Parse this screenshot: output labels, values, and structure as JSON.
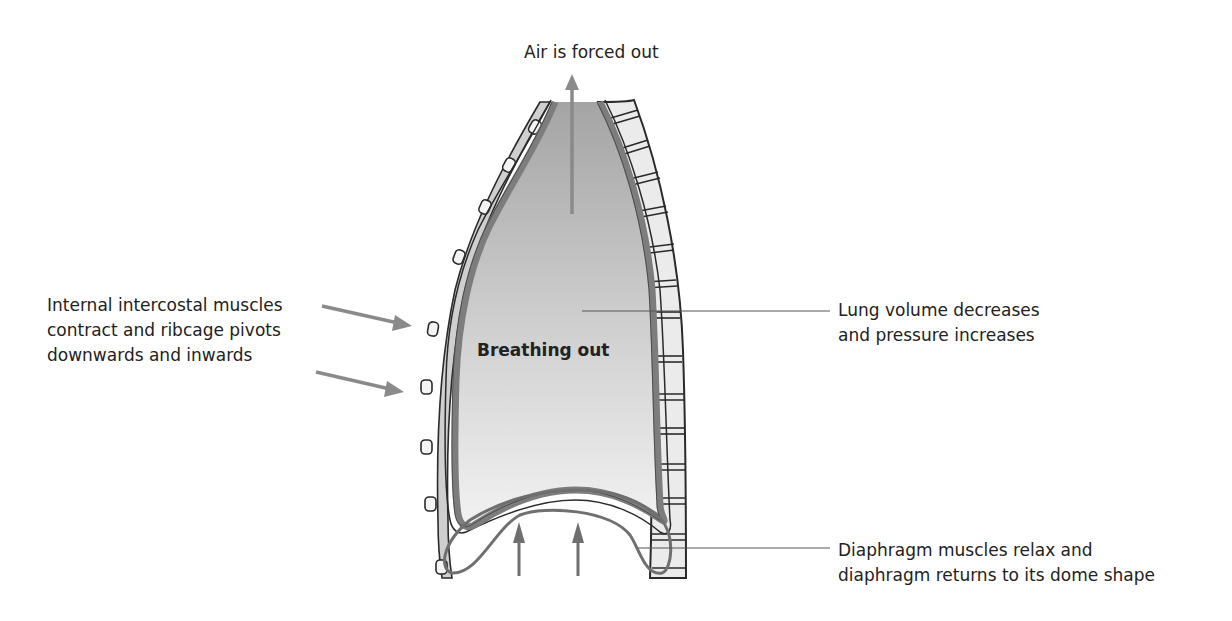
{
  "diagram": {
    "title": "Breathing out",
    "labels": {
      "top": "Air is forced out",
      "left": [
        "Internal intercostal muscles",
        "contract and ribcage pivots",
        "downwards and inwards"
      ],
      "right_middle": [
        "Lung volume decreases",
        "and pressure increases"
      ],
      "right_bottom": [
        "Diaphragm muscles relax and",
        "diaphragm returns to its dome shape"
      ]
    },
    "arrows": {
      "air_out": "up",
      "ribcage": [
        "inward",
        "inward"
      ],
      "diaphragm": [
        "up",
        "up"
      ]
    },
    "colors": {
      "arrow": "#8a8a8a",
      "lung_fill_top": "#a9a9a9",
      "lung_fill_bottom": "#efefef",
      "pleura": "#7d7d7d",
      "outline": "#2a2a2a",
      "bone": "#e6e6e6",
      "rib_cartilage": "#c8c8c8"
    }
  }
}
